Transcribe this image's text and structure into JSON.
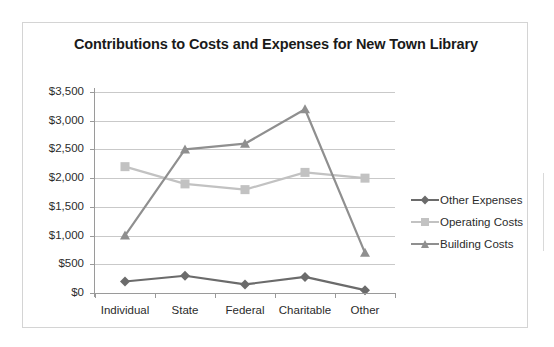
{
  "chart_data": {
    "type": "line",
    "title": "Contributions to Costs and Expenses for New Town Library",
    "xlabel": "",
    "ylabel": "",
    "categories": [
      "Individual",
      "State",
      "Federal",
      "Charitable",
      "Other"
    ],
    "ylim": [
      0,
      3500
    ],
    "ytick_values": [
      0,
      500,
      1000,
      1500,
      2000,
      2500,
      3000,
      3500
    ],
    "ytick_labels": [
      "$0",
      "$500",
      "$1,000",
      "$1,500",
      "$2,000",
      "$2,500",
      "$3,000",
      "$3,500"
    ],
    "grid": true,
    "legend_position": "right",
    "series": [
      {
        "name": "Other Expenses",
        "color": "#6b6b6b",
        "marker": "diamond",
        "values": [
          200,
          300,
          150,
          280,
          50
        ]
      },
      {
        "name": "Operating Costs",
        "color": "#c2c2c2",
        "marker": "square",
        "values": [
          2200,
          1900,
          1800,
          2100,
          2000
        ]
      },
      {
        "name": "Building Costs",
        "color": "#8f8f8f",
        "marker": "triangle",
        "values": [
          1000,
          2500,
          2600,
          3200,
          700
        ]
      }
    ]
  },
  "style": {
    "frame_border_color": "#d4d4d4",
    "gridline_color": "#c9c9c9",
    "axis_color": "#9a9a9a",
    "text_color": "#2b2b2b",
    "title_color": "#1a1a1a",
    "background": "#ffffff"
  }
}
